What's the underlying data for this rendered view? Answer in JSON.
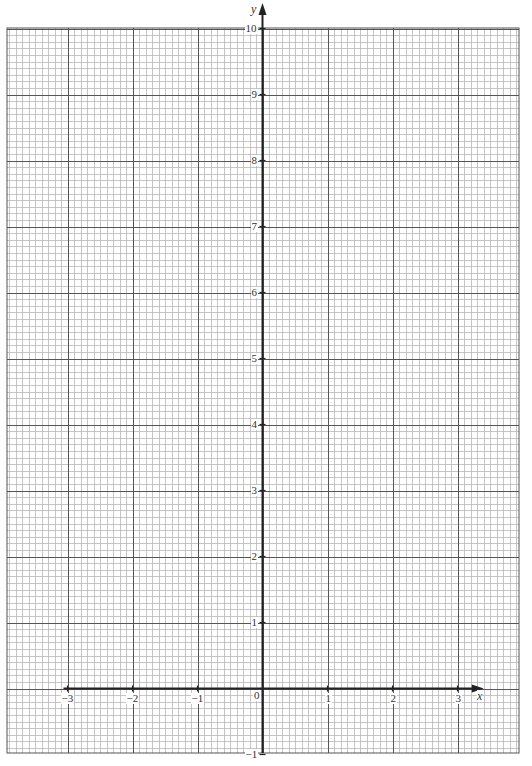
{
  "chart_data": {
    "type": "grid",
    "title": "",
    "xlabel": "x",
    "ylabel": "y",
    "xlim": [
      -4,
      3.95
    ],
    "ylim": [
      -1,
      10
    ],
    "x_ticks": [
      "−3",
      "−2",
      "−1",
      "0",
      "1",
      "2",
      "3"
    ],
    "x_tick_values": [
      -3,
      -2,
      -1,
      0,
      1,
      2,
      3
    ],
    "y_ticks": [
      "−1",
      "1",
      "2",
      "3",
      "4",
      "5",
      "6",
      "7",
      "8",
      "9",
      "10"
    ],
    "y_tick_values": [
      -1,
      1,
      2,
      3,
      4,
      5,
      6,
      7,
      8,
      9,
      10
    ],
    "grid": true,
    "minor_divisions_per_unit": 10,
    "series": []
  },
  "labels": {
    "x_axis": "x",
    "y_axis": "y",
    "origin": "0"
  },
  "colors": {
    "minor_grid": "#b8b8b8",
    "major_grid": "#555555",
    "axis": "#222222",
    "text": "#333333"
  }
}
